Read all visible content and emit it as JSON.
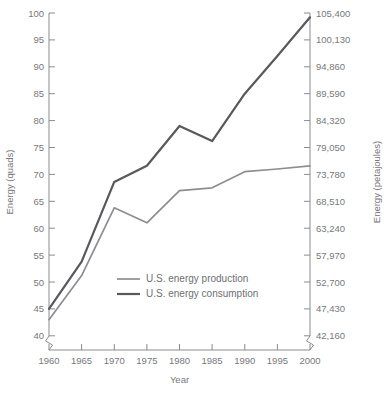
{
  "chart_data": {
    "type": "line",
    "title": "",
    "xlabel": "Year",
    "ylabel": "Energy (quads)",
    "y2label": "Energy (petajoules)",
    "x": [
      1960,
      1965,
      1970,
      1975,
      1980,
      1985,
      1990,
      1995,
      2000
    ],
    "xlim": [
      1960,
      2000
    ],
    "ylim": [
      40,
      100
    ],
    "y2lim": [
      42160,
      105400
    ],
    "grid": false,
    "legend_position": "inside-lower-left",
    "axis_break": true,
    "xticks": [
      "1960",
      "1965",
      "1970",
      "1975",
      "1980",
      "1985",
      "1990",
      "1995",
      "2000"
    ],
    "yticks": [
      "40",
      "45",
      "50",
      "55",
      "60",
      "65",
      "70",
      "75",
      "80",
      "85",
      "90",
      "95",
      "100"
    ],
    "y2ticks": [
      "42,160",
      "47,430",
      "52,700",
      "57,970",
      "63,240",
      "68,510",
      "73,780",
      "79,050",
      "84,320",
      "89,590",
      "94,860",
      "100,130",
      "105,400"
    ],
    "series": [
      {
        "name": "U.S. energy production",
        "color": "#8d8e91",
        "width": 1.7,
        "values": [
          43.0,
          51.2,
          63.8,
          61.0,
          67.0,
          67.5,
          70.5,
          71.0,
          71.6
        ]
      },
      {
        "name": "U.S. energy consumption",
        "color": "#58595c",
        "width": 2.2,
        "values": [
          45.0,
          53.8,
          68.6,
          71.6,
          79.0,
          76.2,
          85.0,
          92.0,
          99.2
        ]
      }
    ]
  }
}
